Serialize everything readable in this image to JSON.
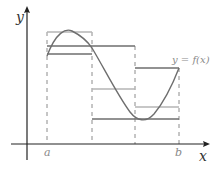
{
  "diagram": {
    "title": "",
    "labels": {
      "y_axis": "y",
      "x_axis": "x",
      "a": "a",
      "b": "b",
      "curve": "y = f(x)"
    },
    "colors": {
      "axis": "#222222",
      "curve": "#6e6e6e",
      "lower_sum": "#6e6e6e",
      "upper_sum": "#b4b4b4",
      "dashed": "#8c8c8c"
    },
    "partition": {
      "points": [
        "a",
        "",
        "",
        "b"
      ],
      "pixel_x": [
        47,
        92,
        135,
        179
      ]
    },
    "intervals": [
      {
        "index": 1,
        "upper_level_px": 32,
        "lower_level_px": 54
      },
      {
        "index": 2,
        "upper_level_px": 46,
        "lower_level_px": 89
      },
      {
        "index": 3,
        "upper_level_px": 68,
        "lower_level_px": 119
      }
    ]
  }
}
